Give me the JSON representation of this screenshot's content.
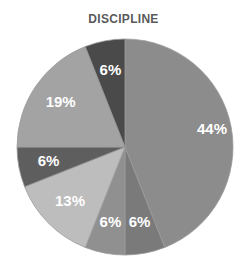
{
  "chart_data": {
    "type": "pie",
    "title": "DISCIPLINE",
    "categories": [
      "Slice 1",
      "Slice 2",
      "Slice 3",
      "Slice 4",
      "Slice 5",
      "Slice 6",
      "Slice 7"
    ],
    "values": [
      44,
      6,
      6,
      13,
      6,
      19,
      6
    ],
    "labels": [
      "44%",
      "6%",
      "6%",
      "13%",
      "6%",
      "19%",
      "6%"
    ],
    "colors": [
      "#8c8c8c",
      "#7a7a7a",
      "#909090",
      "#bdbdbd",
      "#5e5e5e",
      "#a3a3a3",
      "#4a4a4a"
    ],
    "start_angle_deg": 0,
    "direction": "clockwise",
    "legend": "none"
  }
}
